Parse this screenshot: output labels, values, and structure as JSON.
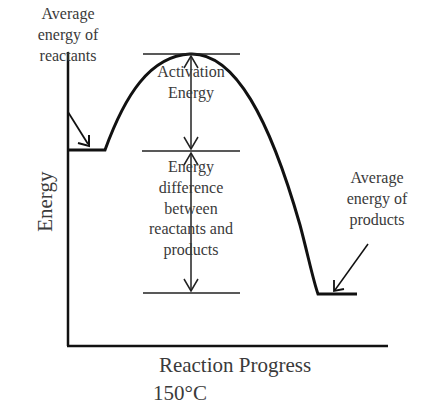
{
  "diagram": {
    "type": "energy-profile",
    "axes": {
      "x_label": "Reaction Progress",
      "y_label": "Energy"
    },
    "temperature": "150°C",
    "labels": {
      "reactants": [
        "Average",
        "energy of",
        "reactants"
      ],
      "products": [
        "Average",
        "energy of",
        "products"
      ],
      "activation": [
        "Activation",
        "Energy"
      ],
      "difference": [
        "Energy",
        "difference",
        "between",
        "reactants and",
        "products"
      ]
    },
    "colors": {
      "line": "#111111",
      "text": "#3a3a3a",
      "background": "#ffffff"
    }
  }
}
